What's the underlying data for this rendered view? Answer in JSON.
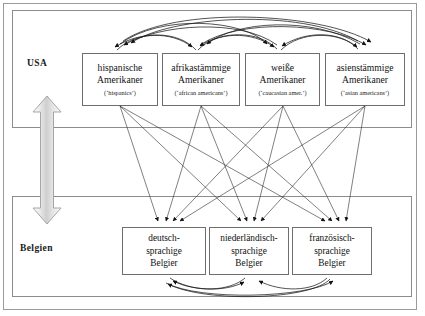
{
  "diagram": {
    "regions": [
      {
        "id": "usa",
        "label": "USA"
      },
      {
        "id": "belgien",
        "label": "Belgien"
      }
    ],
    "usa_groups": [
      {
        "id": "hispanic",
        "line1": "hispanische",
        "line2": "Amerikaner",
        "gloss": "(‘hispanics’)"
      },
      {
        "id": "african",
        "line1": "afrikastämmige",
        "line2": "Amerikaner",
        "gloss": "(‘african americans’)"
      },
      {
        "id": "white",
        "line1": "weiße",
        "line2": "Amerikaner",
        "gloss": "(‘caucasian amer.’)"
      },
      {
        "id": "asian",
        "line1": "asienstämmige",
        "line2": "Amerikaner",
        "gloss": "(‘asian americans’)"
      }
    ],
    "belgien_groups": [
      {
        "id": "deutsch",
        "line1": "deutsch-",
        "line2": "sprachige",
        "line3": "Belgier"
      },
      {
        "id": "niederlaendisch",
        "line1": "niederländisch-",
        "line2": "sprachige",
        "line3": "Belgier"
      },
      {
        "id": "franzoesisch",
        "line1": "französisch-",
        "line2": "sprachige",
        "line3": "Belgier"
      }
    ],
    "connector": {
      "name": "vertical-double-arrow",
      "direction": "both",
      "color_light": "#f2f2f2",
      "color_dark": "#b9b9b9",
      "outline": "#9d9d9d"
    },
    "colors": {
      "frame": "#9a9a9a",
      "box_border": "#6e6e6e",
      "arrow": "#1a1a1a",
      "text": "#111111",
      "background": "#ffffff"
    }
  }
}
